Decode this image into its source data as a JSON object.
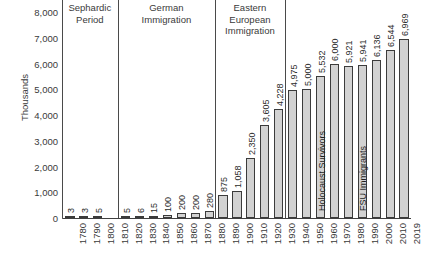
{
  "chart_data": {
    "type": "bar",
    "title": "",
    "subtitle": "",
    "xlabel": "",
    "ylabel": "Thousands",
    "ylim": [
      0,
      8000
    ],
    "ytick_step": 1000,
    "grid": false,
    "legend": "none",
    "bar_color": "#d2d2d2",
    "bar_edge_color": "#3b3b3b",
    "categories": [
      "1780",
      "1790",
      "1800",
      "1810",
      "1820",
      "1830",
      "1840",
      "1850",
      "1860",
      "1870",
      "1880",
      "1890",
      "1900",
      "1910",
      "1920",
      "1930",
      "1940",
      "1950",
      "1960",
      "1970",
      "1980",
      "1990",
      "2000",
      "2010",
      "2019"
    ],
    "values": [
      3,
      3,
      5,
      null,
      5,
      6,
      15,
      100,
      200,
      200,
      280,
      875,
      1058,
      2350,
      3605,
      4228,
      4975,
      5000,
      5532,
      6000,
      5921,
      5941,
      6136,
      6544,
      6969
    ],
    "value_labels": [
      "3",
      "3",
      "5",
      "",
      "5",
      "6",
      "15",
      "100",
      "200",
      "200",
      "280",
      "875",
      "1,058",
      "2,350",
      "3,605",
      "4,228",
      "4,975",
      "5,000",
      "5,532",
      "6,000",
      "5,921",
      "5,941",
      "6,136",
      "6,544",
      "6,969"
    ],
    "ytick_labels": [
      "8,000",
      "7,000",
      "6,000",
      "5,000",
      "4,000",
      "3,000",
      "2,000",
      "1,000",
      "0"
    ],
    "ytick_values": [
      8000,
      7000,
      6000,
      5000,
      4000,
      3000,
      2000,
      1000,
      0
    ],
    "annotations": [
      {
        "name": "sephardic-period",
        "label": "Sephardic\nPeriod",
        "start_category": "1780",
        "end_category": "1810"
      },
      {
        "name": "german-immigration",
        "label": "German\nImmigration",
        "start_category": "1820",
        "end_category": "1880"
      },
      {
        "name": "eastern-european-immigration",
        "label": "Eastern\nEuropean\nImmigration",
        "start_category": "1890",
        "end_category": "1930"
      }
    ],
    "bar_inner_labels": [
      {
        "category": "1960",
        "label": "Holocaust Survivors"
      },
      {
        "category": "1990",
        "label": "FSU Immigrants"
      }
    ]
  }
}
